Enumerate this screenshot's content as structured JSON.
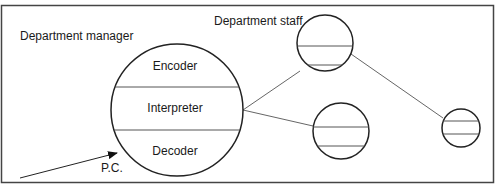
{
  "diagram": {
    "labels": {
      "manager": "Department manager",
      "staff": "Department staff",
      "encoder": "Encoder",
      "interpreter": "Interpreter",
      "decoder": "Decoder",
      "pc": "P.C."
    },
    "colors": {
      "stroke": "#222222",
      "connector": "#555555",
      "divider": "#555555",
      "background": "#ffffff"
    },
    "nodes": [
      {
        "id": "manager",
        "sections": [
          "Encoder",
          "Interpreter",
          "Decoder"
        ]
      },
      {
        "id": "staff-1",
        "sections": [
          "",
          "",
          ""
        ]
      },
      {
        "id": "staff-2",
        "sections": [
          "",
          "",
          ""
        ]
      },
      {
        "id": "staff-3",
        "sections": [
          "",
          "",
          ""
        ]
      }
    ],
    "edges": [
      {
        "from": "manager",
        "to": "staff-1"
      },
      {
        "from": "manager",
        "to": "staff-2"
      },
      {
        "from": "staff-1",
        "to": "staff-3"
      },
      {
        "from": "P.C.",
        "to": "manager",
        "arrow": true
      }
    ]
  }
}
